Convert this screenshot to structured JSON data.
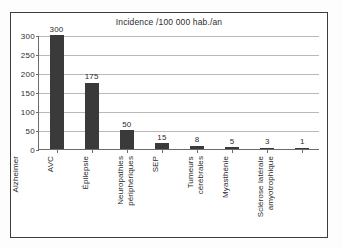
{
  "chart_data": {
    "type": "bar",
    "title": "Incidence /100 000 hab./an",
    "xlabel": "",
    "ylabel": "",
    "ylim": [
      0,
      300
    ],
    "yticks": [
      0,
      50,
      100,
      150,
      200,
      250,
      300
    ],
    "grid": true,
    "legend": false,
    "categories": [
      "Alzheimer",
      "AVC",
      "Épilepsie",
      "Neuropathies\npériphériques",
      "SEP",
      "Tumeurs\ncérébrales",
      "Myasthénie",
      "Sclérose latérale\namyotrophique"
    ],
    "values": [
      300,
      175,
      50,
      15,
      8,
      5,
      3,
      1
    ],
    "value_labels": [
      "300",
      "175",
      "50",
      "15",
      "8",
      "5",
      "3",
      "1"
    ],
    "bar_color": "#3a3a3a",
    "grid_color": "#b9b9b9",
    "axis_color": "#6b6b6b",
    "background": "#ffffff"
  }
}
